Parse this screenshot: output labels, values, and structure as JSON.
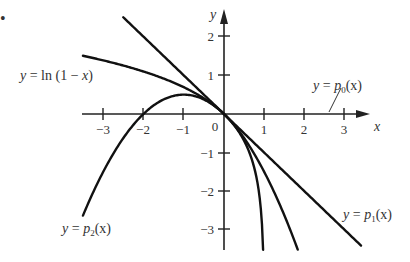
{
  "chart_data": {
    "type": "line",
    "title": "",
    "xlabel": "x",
    "ylabel": "y",
    "xlim": [
      -3.5,
      3.4
    ],
    "ylim": [
      -3.5,
      2.5
    ],
    "grid": false,
    "legend": "none (inline curve labels)",
    "x_ticks": [
      "-3",
      "-2",
      "-1",
      "0",
      "1",
      "2",
      "3"
    ],
    "y_ticks": [
      "2",
      "1",
      "-1",
      "-2",
      "-3"
    ],
    "series": [
      {
        "name": "y = ln(1 − x)",
        "formula": "ln(1-x)",
        "x_range": [
          -3.5,
          0.97
        ]
      },
      {
        "name": "y = p0(x)",
        "formula": "0",
        "note": "coincides with x-axis"
      },
      {
        "name": "y = p1(x)",
        "formula": "-x",
        "x_range": [
          -2.5,
          3.4
        ]
      },
      {
        "name": "y = p2(x)",
        "formula": "-x - x^2/2",
        "x_range": [
          -3.5,
          1.83
        ]
      }
    ],
    "annotations": [
      {
        "text": "y = ln (1 − x)",
        "position": "left, above x-axis"
      },
      {
        "text": "y = p0(x)",
        "position": "right, above x-axis with leader line to x-axis"
      },
      {
        "text": "y = p1(x)",
        "position": "lower right"
      },
      {
        "text": "y = p2(x)",
        "position": "lower left"
      }
    ]
  },
  "labels": {
    "bullet": "•",
    "x_axis": "x",
    "y_axis": "y",
    "origin": "0",
    "ln": {
      "y": "y",
      "eq": " = ln (1 − ",
      "x": "x",
      "close": ")"
    },
    "p0": {
      "y": "y",
      "eq": " = ",
      "p": "p",
      "sub": "0",
      "arg": "(x)"
    },
    "p1": {
      "y": "y",
      "eq": " = ",
      "p": "p",
      "sub": "1",
      "arg": "(x)"
    },
    "p2": {
      "y": "y",
      "eq": " = ",
      "p": "p",
      "sub": "2",
      "arg": "(x)"
    },
    "xticks": [
      "−3",
      "−2",
      "−1",
      "1",
      "2",
      "3"
    ],
    "yticks": [
      "2",
      "1",
      "−1",
      "−2",
      "−3"
    ]
  }
}
